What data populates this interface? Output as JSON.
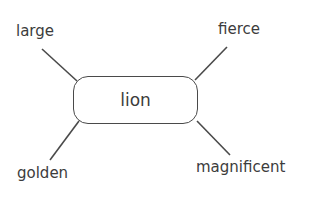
{
  "diagram": {
    "type": "word-web",
    "center": {
      "label": "lion"
    },
    "branches": [
      {
        "position": "top-left",
        "label": "large"
      },
      {
        "position": "top-right",
        "label": "fierce"
      },
      {
        "position": "bottom-left",
        "label": "golden"
      },
      {
        "position": "bottom-right",
        "label": "magnificent"
      }
    ],
    "colors": {
      "stroke": "#4a4a4a",
      "text": "#3c3c3c",
      "background": "#ffffff"
    }
  }
}
